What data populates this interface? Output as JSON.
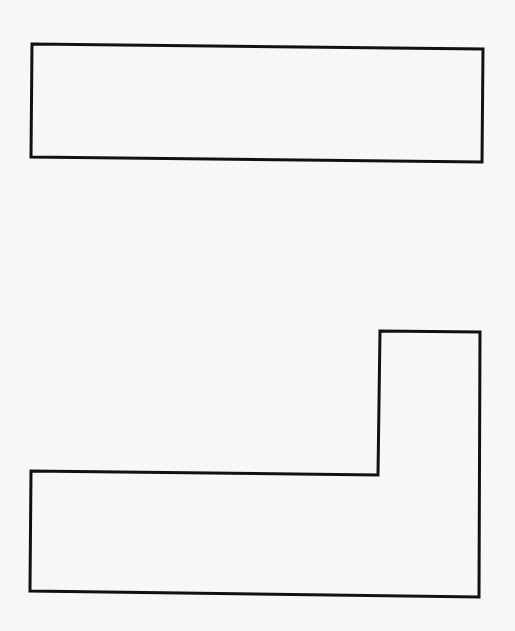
{
  "diagram": {
    "background": "#f7f7f7",
    "stroke_color": "#111111",
    "stroke_width": 3,
    "shapes": [
      {
        "name": "rectangle",
        "points": "32,44 483,49 482,162 31,157"
      },
      {
        "name": "l-shape",
        "points": "380,331 480,332 479,597 30,591 31,471 378,475"
      }
    ]
  }
}
